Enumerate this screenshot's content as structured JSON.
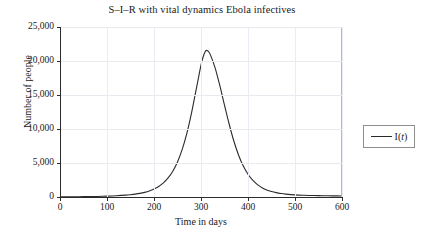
{
  "chart_data": {
    "type": "line",
    "title": "S–I–R with vital dynamics Ebola infectives",
    "xlabel": "Time in days",
    "ylabel": "Number of people",
    "xlim": [
      0,
      600
    ],
    "ylim": [
      0,
      25000
    ],
    "grid": true,
    "legend_position": "right-outside",
    "xticks": [
      0,
      100,
      200,
      300,
      400,
      500,
      600
    ],
    "xticklabels": [
      "0",
      "100",
      "200",
      "300",
      "400",
      "500",
      "600"
    ],
    "yticks": [
      0,
      5000,
      10000,
      15000,
      20000,
      25000
    ],
    "yticklabels": [
      "0",
      "5,000",
      "10,000",
      "15,000",
      "20,000",
      "25,000"
    ],
    "series": [
      {
        "name": "I(t)",
        "color": "#2b2b2b",
        "peak_x": 310,
        "peak_y": 21500,
        "x": [
          0,
          20,
          40,
          60,
          80,
          100,
          120,
          140,
          150,
          160,
          170,
          180,
          190,
          200,
          210,
          220,
          230,
          240,
          250,
          260,
          270,
          280,
          290,
          300,
          305,
          310,
          315,
          320,
          330,
          340,
          350,
          360,
          370,
          380,
          390,
          400,
          410,
          420,
          430,
          440,
          450,
          460,
          470,
          480,
          500,
          520,
          540,
          560,
          580,
          600
        ],
        "values": [
          20,
          28,
          40,
          58,
          84,
          122,
          180,
          270,
          335,
          420,
          530,
          680,
          880,
          1160,
          1540,
          2070,
          2800,
          3800,
          5150,
          7000,
          9400,
          12400,
          15900,
          19400,
          20700,
          21500,
          21450,
          20900,
          19000,
          16400,
          13500,
          10700,
          8200,
          6150,
          4550,
          3350,
          2470,
          1830,
          1370,
          1040,
          810,
          640,
          520,
          430,
          310,
          250,
          210,
          185,
          168,
          155
        ]
      }
    ]
  },
  "legend": {
    "entries": [
      {
        "label_prefix": "I(",
        "label_italic": "t",
        "label_suffix": ")"
      }
    ]
  }
}
